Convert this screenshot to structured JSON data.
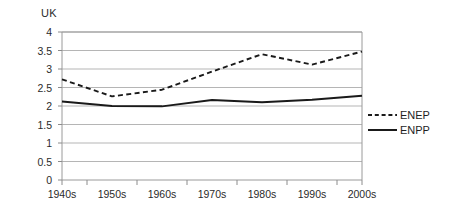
{
  "chart_data": {
    "type": "line",
    "title": "UK",
    "xlabel": "",
    "ylabel": "",
    "ylim": [
      0,
      4
    ],
    "yticks": [
      "0",
      "0.5",
      "1",
      "1.5",
      "2",
      "2.5",
      "3",
      "3.5",
      "4"
    ],
    "grid": true,
    "legend_position": "right",
    "categories": [
      "1940s",
      "1950s",
      "1960s",
      "1970s",
      "1980s",
      "1990s",
      "2000s"
    ],
    "series": [
      {
        "name": "ENEP",
        "style": "dashed",
        "color": "#1a1a1a",
        "values": [
          2.72,
          2.26,
          2.44,
          2.93,
          3.4,
          3.12,
          3.47
        ]
      },
      {
        "name": "ENPP",
        "style": "solid",
        "color": "#1a1a1a",
        "values": [
          2.12,
          2.0,
          1.99,
          2.16,
          2.1,
          2.17,
          2.28
        ]
      }
    ]
  },
  "legend": {
    "entries": [
      {
        "label": "ENEP"
      },
      {
        "label": "ENPP"
      }
    ]
  },
  "axes": {
    "frame_color": "#9a9a9a",
    "grid_color": "#b5b5b5",
    "tick_color": "#8c8c8c"
  }
}
